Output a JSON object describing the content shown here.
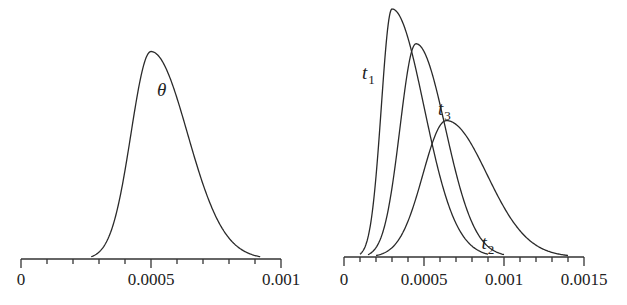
{
  "chart_data": [
    {
      "type": "line",
      "title": "",
      "xlabel": "",
      "ylabel": "",
      "xlim": [
        0,
        0.001
      ],
      "x_ticks": [
        0,
        0.0005,
        0.001
      ],
      "x_tick_labels": [
        "0",
        "0.0005",
        "0.001"
      ],
      "minor_ticks_count": 10,
      "grid": false,
      "legend": "none (inline curve labels)",
      "series": [
        {
          "name": "θ",
          "label_main": "θ",
          "label_sub": "",
          "peak_x": 0.0005,
          "peak_rel_height": 0.83,
          "support": [
            0.00027,
            0.00092
          ],
          "shape": "near-symmetric unimodal, slight right skew"
        }
      ]
    },
    {
      "type": "line",
      "title": "",
      "xlabel": "",
      "ylabel": "",
      "xlim": [
        0,
        0.0015
      ],
      "x_ticks": [
        0,
        0.0005,
        0.001,
        0.0015
      ],
      "x_tick_labels": [
        "0",
        "0.0005",
        "0.001",
        "0.0015"
      ],
      "minor_ticks_count": 15,
      "grid": false,
      "legend": "none (inline curve labels)",
      "series": [
        {
          "name": "t1",
          "label_main": "t",
          "label_sub": "1",
          "peak_x": 0.0003,
          "peak_rel_height": 1.0,
          "support": [
            0.0001,
            0.0009
          ],
          "shape": "narrow, right skewed"
        },
        {
          "name": "t3",
          "label_main": "t",
          "label_sub": "3",
          "peak_x": 0.00045,
          "peak_rel_height": 0.86,
          "support": [
            0.00015,
            0.001
          ],
          "shape": "moderate, right skewed"
        },
        {
          "name": "t2",
          "label_main": "t",
          "label_sub": "2",
          "peak_x": 0.00064,
          "peak_rel_height": 0.55,
          "support": [
            0.0002,
            0.0014
          ],
          "shape": "wide, right skewed"
        }
      ]
    }
  ]
}
